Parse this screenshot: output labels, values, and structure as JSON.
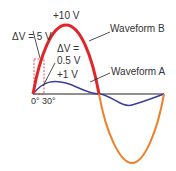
{
  "diagram": {
    "labels": {
      "peak_b": "+10 V",
      "delta_b": "ΔV = 5 V",
      "delta_a_line1": "ΔV =",
      "delta_a_line2": "0.5 V",
      "peak_a": "+1 V",
      "waveform_b": "Waveform B",
      "waveform_a": "Waveform A",
      "tick_0": "0°",
      "tick_30": "30°"
    },
    "colors": {
      "waveform_b_positive": "#e0262b",
      "waveform_b_negative": "#f07f2a",
      "waveform_a": "#3b3e9c",
      "axis": "#222222",
      "dashed_box": "#e0262b"
    },
    "waveforms": [
      {
        "name": "Waveform A",
        "amplitude_v": 1,
        "delta_v_at_30deg": 0.5
      },
      {
        "name": "Waveform B",
        "amplitude_v": 10,
        "delta_v_at_30deg": 5
      }
    ]
  }
}
